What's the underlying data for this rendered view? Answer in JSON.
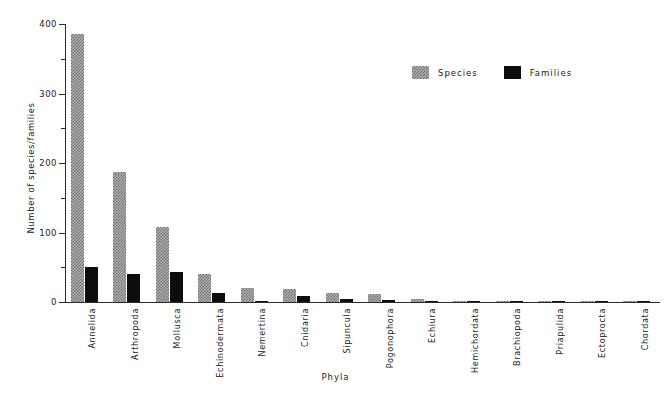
{
  "chart_data": {
    "type": "bar",
    "title": "",
    "xlabel": "Phyla",
    "ylabel": "Number of species/families",
    "ylim": [
      0,
      400
    ],
    "yticks": [
      0,
      100,
      200,
      300,
      400
    ],
    "ytick_labels": [
      "0",
      "100",
      "200",
      "300",
      "400"
    ],
    "yminor_ticks": [
      50,
      150,
      250,
      350
    ],
    "grid": false,
    "legend_position": "upper right",
    "categories": [
      "Annelida",
      "Arthropoda",
      "Mollusca",
      "Echinodermata",
      "Nemertina",
      "Cnidaria",
      "Sipuncula",
      "Pogonophora",
      "Echiura",
      "Hemichordata",
      "Brachiopoda",
      "Priapulida",
      "Ectoprocta",
      "Chordata"
    ],
    "series": [
      {
        "name": "Species",
        "color": "#b0b0b0",
        "pattern": "stipple",
        "values": [
          385,
          187,
          108,
          40,
          20,
          19,
          13,
          12,
          5,
          2,
          2,
          2,
          1,
          2
        ]
      },
      {
        "name": "Families",
        "color": "#0d0d0d",
        "pattern": "solid",
        "values": [
          50,
          41,
          43,
          13,
          0,
          9,
          4,
          3,
          2,
          1,
          2,
          1,
          1,
          2
        ]
      }
    ]
  },
  "legend": {
    "items": [
      {
        "label": "Species"
      },
      {
        "label": "Families"
      }
    ]
  },
  "axis": {
    "y_title": "Number of species/families",
    "x_title": "Phyla"
  }
}
